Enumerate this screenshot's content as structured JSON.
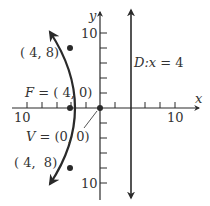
{
  "figure": {
    "type": "parabola-diagram",
    "axes": {
      "x_label": "x",
      "y_label": "y",
      "x_tick_left_label": "10",
      "x_tick_right_label": "10",
      "y_tick_top_label": "10",
      "y_tick_bottom_label": "10",
      "tick_step": 2
    },
    "directrix": {
      "prefix": "D:",
      "var": "x",
      "eq": " = 4"
    },
    "focus": {
      "prefix": "F",
      "value": " = ( 4, 0)"
    },
    "vertex": {
      "prefix": "V",
      "value": " = (0, 0)"
    },
    "point_upper": {
      "label": "( 4, 8)"
    },
    "point_lower": {
      "label": "( 4,  8)"
    },
    "colors": {
      "ink": "#2a2a2a",
      "text": "#333333"
    }
  }
}
